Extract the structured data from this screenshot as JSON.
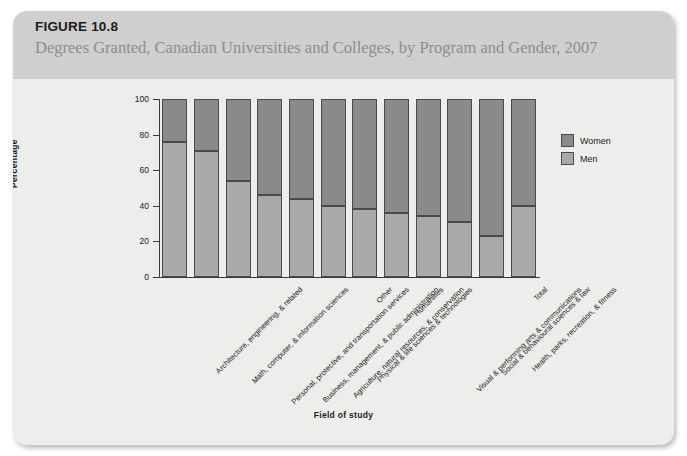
{
  "figure": {
    "number": "FIGURE 10.8",
    "subtitle": "Degrees Granted, Canadian Universities and Colleges, by Program and Gender, 2007"
  },
  "legend": {
    "position": "right",
    "entries": [
      {
        "label": "Women",
        "color": "#8a8a8a"
      },
      {
        "label": "Men",
        "color": "#a9a9a9"
      }
    ]
  },
  "colors": {
    "women": "#8a8a8a",
    "men": "#a9a9a9",
    "header_band": "#cfcfcf",
    "panel": "#ededeb",
    "axis": "#3a3a3a"
  },
  "chart_data": {
    "type": "bar",
    "stacked": true,
    "stack_total": 100,
    "title": "Degrees Granted, Canadian Universities and Colleges, by Program and Gender, 2007",
    "xlabel": "Field of study",
    "ylabel": "Percentage",
    "ylim": [
      0,
      100
    ],
    "yticks": [
      0,
      20,
      40,
      60,
      80,
      100
    ],
    "grid": false,
    "categories": [
      "Architecture, engineering, & related",
      "Math, computer, & information sciences",
      "Personal, protective, and transportation services",
      "Business, management, & public administration",
      "Agriculture, natural resources, & conservation",
      "Physical & life sciences & technologies",
      "Other",
      "Humanities",
      "Visual & performing arts & communications",
      "Social & behavioural sciences & law",
      "Health, parks, recreation, & fitness",
      "Total"
    ],
    "series": [
      {
        "name": "Men",
        "color": "#a9a9a9",
        "values": [
          76,
          71,
          54,
          46,
          44,
          40,
          38,
          36,
          34,
          31,
          23,
          40
        ]
      },
      {
        "name": "Women",
        "color": "#8a8a8a",
        "values": [
          24,
          29,
          46,
          54,
          56,
          60,
          62,
          64,
          66,
          69,
          77,
          60
        ]
      }
    ]
  }
}
